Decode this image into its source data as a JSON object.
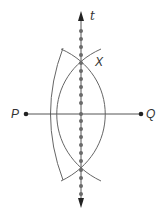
{
  "diagram": {
    "type": "perpendicular-bisector-construction",
    "labels": {
      "line": "t",
      "intersection": "X",
      "left_point": "P",
      "right_point": "Q"
    },
    "colors": {
      "line": "#555555",
      "arc": "#666666",
      "dot": "#666666",
      "point": "#222222",
      "text": "#333333"
    }
  }
}
